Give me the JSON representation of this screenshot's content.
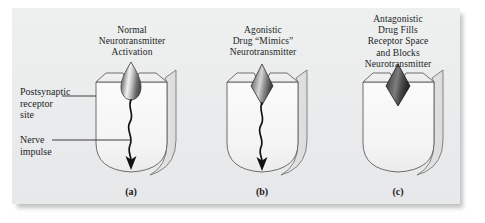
{
  "figure": {
    "background_color": "#ffffff",
    "plate_color": "#eceded",
    "ink_color": "#221f1f",
    "panels": [
      {
        "id": "a",
        "letter": "(a)",
        "title": "Normal\nNeurotransmitter\nActivation",
        "molecule": "teardrop-neurotransmitter",
        "molecule_shade": "light-gray-gradient",
        "impulse": "wavy-arrow-down",
        "impulse_present": true
      },
      {
        "id": "b",
        "letter": "(b)",
        "title": "Agonistic\nDrug “Mimics”\nNeurotransmitter",
        "molecule": "diamond-agonist",
        "molecule_shade": "medium-gray-gradient",
        "impulse": "wavy-arrow-down",
        "impulse_present": true
      },
      {
        "id": "c",
        "letter": "(c)",
        "title": "Antagonistic\nDrug Fills\nReceptor Space\nand Blocks\nNeurotransmitter",
        "molecule": "diamond-antagonist",
        "molecule_shade": "dark-gray-gradient",
        "impulse": "none",
        "impulse_present": false
      }
    ],
    "annotations": [
      {
        "id": "receptor",
        "text": "Postsynaptic\nreceptor\nsite"
      },
      {
        "id": "impulse",
        "text": "Nerve\nimpulse"
      }
    ]
  }
}
